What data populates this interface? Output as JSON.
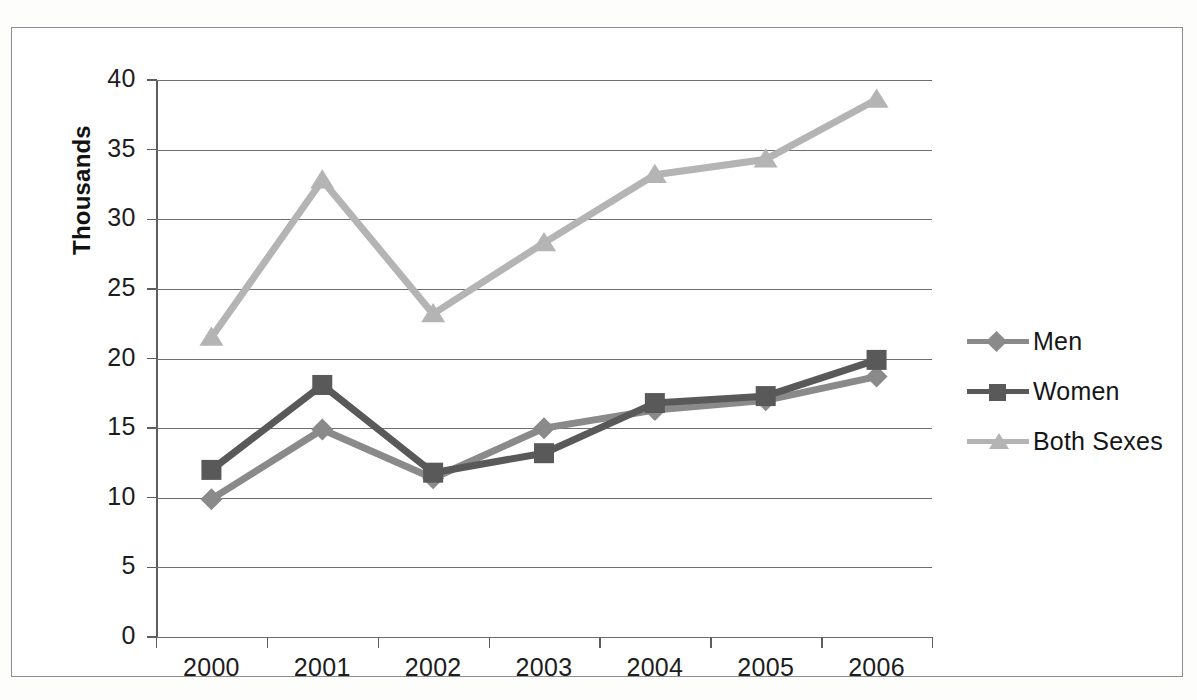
{
  "chart_data": {
    "type": "line",
    "title": "",
    "xlabel": "",
    "ylabel": "Thousands",
    "categories": [
      "2000",
      "2001",
      "2002",
      "2003",
      "2004",
      "2005",
      "2006"
    ],
    "ylim": [
      0,
      40
    ],
    "y_ticks": [
      "0",
      "5",
      "10",
      "15",
      "20",
      "25",
      "30",
      "35",
      "40"
    ],
    "grid": true,
    "legend_position": "right",
    "series": [
      {
        "name": "Men",
        "marker": "diamond",
        "color": "#8a8a8a",
        "values": [
          9.9,
          14.9,
          11.4,
          15.0,
          16.3,
          17.0,
          18.7
        ]
      },
      {
        "name": "Women",
        "marker": "square",
        "color": "#595959",
        "values": [
          12.0,
          18.1,
          11.8,
          13.2,
          16.8,
          17.3,
          19.9
        ]
      },
      {
        "name": "Both Sexes",
        "marker": "triangle",
        "color": "#b4b4b4",
        "values": [
          21.5,
          32.8,
          23.2,
          28.3,
          33.2,
          34.3,
          38.6
        ]
      }
    ]
  },
  "legend": {
    "items": [
      {
        "label": "Men"
      },
      {
        "label": "Women"
      },
      {
        "label": "Both Sexes"
      }
    ]
  },
  "axes": {
    "y_title": "Thousands"
  }
}
